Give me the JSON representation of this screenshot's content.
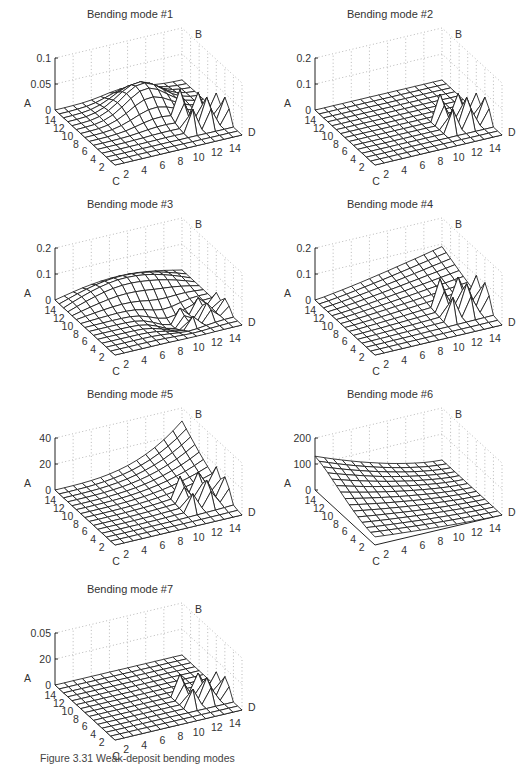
{
  "caption": {
    "label": "Figure 3.31",
    "text": "Weak-deposit bending modes"
  },
  "chart_data": [
    {
      "type": "surface",
      "title": "Bending mode #1",
      "axis_labels": {
        "vertical": "A",
        "back": "B",
        "front_left": "C",
        "right": "D"
      },
      "z_ticks": [
        "0.1",
        "0.05",
        "0"
      ],
      "zlim": [
        0,
        0.1
      ],
      "x_ticks": [
        "2",
        "4",
        "6",
        "8",
        "10",
        "12",
        "14"
      ],
      "y_ticks": [
        "14",
        "12",
        "10",
        "8",
        "6",
        "4",
        "2"
      ],
      "grid_size": 15,
      "description": "Broad smooth hump peaking ~0.05 near the center-back, with small spikes (~0.05) near D edge at index 10-14",
      "shape": "hump",
      "peak": 0.05,
      "spike": 0.05
    },
    {
      "type": "surface",
      "title": "Bending mode #2",
      "axis_labels": {
        "vertical": "A",
        "back": "B",
        "front_left": "C",
        "right": "D"
      },
      "z_ticks": [
        "0.2",
        "0.1",
        "0"
      ],
      "zlim": [
        0,
        0.2
      ],
      "x_ticks": [
        "2",
        "4",
        "6",
        "8",
        "10",
        "12",
        "14"
      ],
      "y_ticks": [
        "14",
        "12",
        "10",
        "8",
        "6",
        "4",
        "2"
      ],
      "grid_size": 15,
      "description": "Flat near zero everywhere except a spike ~0.1 near D corner",
      "shape": "flat",
      "peak": 0.0,
      "spike": 0.1
    },
    {
      "type": "surface",
      "title": "Bending mode #3",
      "axis_labels": {
        "vertical": "A",
        "back": "B",
        "front_left": "C",
        "right": "D"
      },
      "z_ticks": [
        "0.2",
        "0.1",
        "0"
      ],
      "zlim": [
        0,
        0.2
      ],
      "x_ticks": [
        "2",
        "4",
        "6",
        "8",
        "10",
        "12",
        "14"
      ],
      "y_ticks": [
        "14",
        "12",
        "10",
        "8",
        "6",
        "4",
        "2"
      ],
      "grid_size": 15,
      "description": "Saddle/wave surface: raised ridge ~0.1 at back, dipping below zero toward front-right, small spikes near D",
      "shape": "wave",
      "peak": 0.1,
      "spike": 0.05
    },
    {
      "type": "surface",
      "title": "Bending mode #4",
      "axis_labels": {
        "vertical": "A",
        "back": "B",
        "front_left": "C",
        "right": "D"
      },
      "z_ticks": [
        "0.2",
        "0.1",
        "0"
      ],
      "zlim": [
        0,
        0.2
      ],
      "x_ticks": [
        "2",
        "4",
        "6",
        "8",
        "10",
        "12",
        "14"
      ],
      "y_ticks": [
        "14",
        "12",
        "10",
        "8",
        "6",
        "4",
        "2"
      ],
      "grid_size": 15,
      "description": "Smooth rise toward back corner (~0.1), with tall spikes ~0.1 near D edge at index 8-14",
      "shape": "rise",
      "peak": 0.1,
      "spike": 0.1
    },
    {
      "type": "surface",
      "title": "Bending mode #5",
      "axis_labels": {
        "vertical": "A",
        "back": "B",
        "front_left": "C",
        "right": "D"
      },
      "z_ticks": [
        "40",
        "20",
        "0"
      ],
      "zlim": [
        0,
        40
      ],
      "x_ticks": [
        "2",
        "4",
        "6",
        "8",
        "10",
        "12",
        "14"
      ],
      "y_ticks": [
        "14",
        "12",
        "10",
        "8",
        "6",
        "4",
        "2"
      ],
      "grid_size": 15,
      "description": "Exponentially curving surface rising to ~40 at back-right corner (B), near 0 elsewhere, small fins near D",
      "shape": "bowl",
      "peak": 40,
      "spike": 15
    },
    {
      "type": "surface",
      "title": "Bending mode #6",
      "axis_labels": {
        "vertical": "A",
        "back": "B",
        "front_left": "C",
        "right": "D"
      },
      "z_ticks": [
        "200",
        "100",
        "0"
      ],
      "zlim": [
        0,
        200
      ],
      "x_ticks": [
        "2",
        "4",
        "6",
        "8",
        "10",
        "12",
        "14"
      ],
      "y_ticks": [
        "14",
        "12",
        "10",
        "8",
        "6",
        "4",
        "2"
      ],
      "grid_size": 15,
      "description": "Surface high (~130) along A edge, sloping smoothly down toward D/front corner to ~0",
      "shape": "slope",
      "peak": 130,
      "spike": 0
    },
    {
      "type": "surface",
      "title": "Bending mode #7",
      "axis_labels": {
        "vertical": "A",
        "back": "B",
        "front_left": "C",
        "right": "D"
      },
      "z_ticks": [
        "0.05",
        "20",
        "0"
      ],
      "zlim": [
        0,
        0.05
      ],
      "x_ticks": [
        "2",
        "4",
        "6",
        "8",
        "10",
        "12",
        "14"
      ],
      "y_ticks": [
        "14",
        "12",
        "10",
        "8",
        "6",
        "4",
        "2"
      ],
      "grid_size": 15,
      "description": "Flat near zero with several sharp spikes near D edge at index 8-14",
      "shape": "flat",
      "peak": 0.0,
      "spike": 0.02
    }
  ],
  "panels": [
    {
      "x": 0,
      "y": 0
    },
    {
      "x": 260,
      "y": 0
    },
    {
      "x": 0,
      "y": 190
    },
    {
      "x": 260,
      "y": 190
    },
    {
      "x": 0,
      "y": 380
    },
    {
      "x": 260,
      "y": 380
    },
    {
      "x": 0,
      "y": 575
    }
  ]
}
